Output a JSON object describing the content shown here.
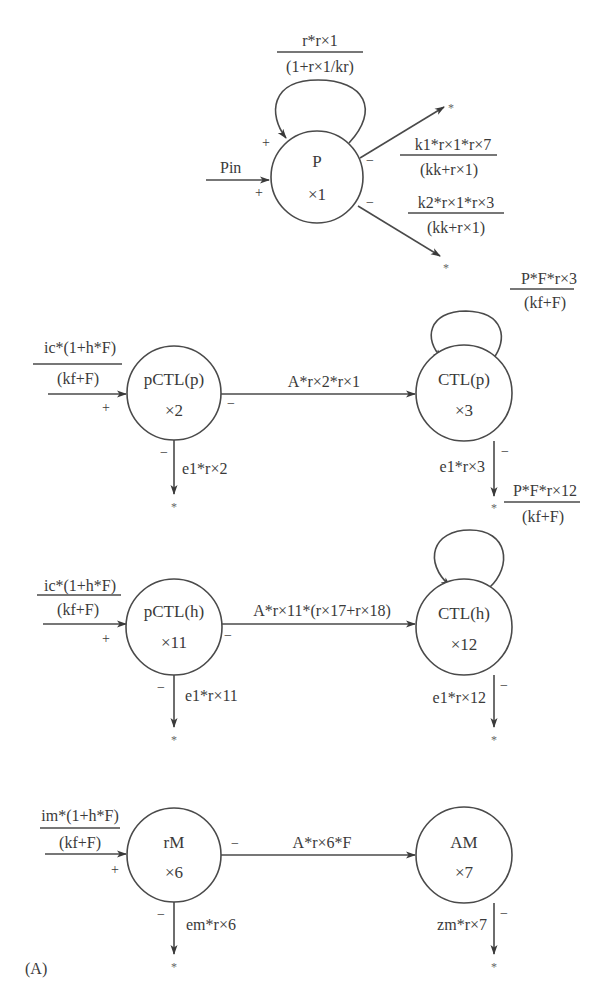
{
  "figure": {
    "panel_label": "(A)",
    "sink_symbol": "*"
  },
  "nodes": {
    "P": {
      "name": "P",
      "var": "×1"
    },
    "pCTLp": {
      "name": "pCTL(p)",
      "var": "×2"
    },
    "CTLp": {
      "name": "CTL(p)",
      "var": "×3"
    },
    "pCTLh": {
      "name": "pCTL(h)",
      "var": "×11"
    },
    "CTLh": {
      "name": "CTL(h)",
      "var": "×12"
    },
    "rM": {
      "name": "rM",
      "var": "×6"
    },
    "AM": {
      "name": "AM",
      "var": "×7"
    }
  },
  "flows": {
    "P_self": {
      "num": "r*r×1",
      "den": "(1+r×1/kr)"
    },
    "P_in": {
      "label": "Pin"
    },
    "P_out1": {
      "num": "k1*r×1*r×7",
      "den": "(kk+r×1)"
    },
    "P_out2": {
      "num": "k2*r×1*r×3",
      "den": "(kk+r×1)"
    },
    "pCTLp_in": {
      "num": "ic*(1+h*F)",
      "den": "(kf+F)"
    },
    "pCTLp_to_CTLp": {
      "label": "A*r×2*r×1"
    },
    "pCTLp_out": {
      "label": "e1*r×2"
    },
    "CTLp_self": {
      "num": "P*F*r×3",
      "den": "(kf+F)"
    },
    "CTLp_out": {
      "label": "e1*r×3"
    },
    "pCTLh_in": {
      "num": "ic*(1+h*F)",
      "den": "(kf+F)"
    },
    "pCTLh_to_CTLh": {
      "label": "A*r×11*(r×17+r×18)"
    },
    "pCTLh_out": {
      "label": "e1*r×11"
    },
    "CTLh_self": {
      "num": "P*F*r×12",
      "den": "(kf+F)"
    },
    "CTLh_out": {
      "label": "e1*r×12"
    },
    "rM_in": {
      "num": "im*(1+h*F)",
      "den": "(kf+F)"
    },
    "rM_to_AM": {
      "label": "A*r×6*F"
    },
    "rM_out": {
      "label": "em*r×6"
    },
    "AM_out": {
      "label": "zm*r×7"
    }
  },
  "signs": {
    "plus": "+",
    "minus": "−"
  }
}
